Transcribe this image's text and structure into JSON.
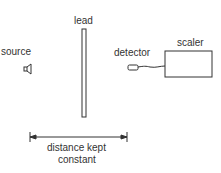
{
  "labels": {
    "source": "source",
    "lead": "lead",
    "detector": "detector",
    "scaler": "scaler",
    "distance_line1": "distance kept",
    "distance_line2": "constant"
  },
  "colors": {
    "stroke": "#333333",
    "background": "#ffffff"
  }
}
